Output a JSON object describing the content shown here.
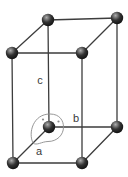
{
  "figure": {
    "kind": "crystal-unit-cell-diagram",
    "axis_labels": {
      "a": "a",
      "b": "b",
      "c": "c"
    }
  },
  "colors": {
    "background": "#ffffff",
    "edge": "#3d3d3d",
    "label": "#3a3a3a",
    "angle_outline": "#8c8c8c",
    "atom_highlight": "#adadad",
    "atom_mid": "#333333",
    "atom_dark": "#030303"
  }
}
